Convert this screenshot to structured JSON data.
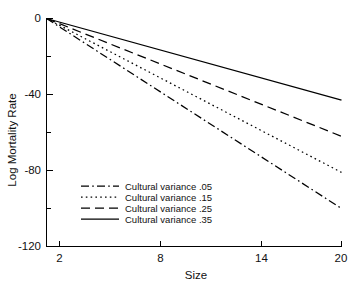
{
  "chart_data": {
    "type": "line",
    "title": "",
    "xlabel": "Size",
    "ylabel": "Log Mortality Rate",
    "xlim": [
      2,
      20
    ],
    "ylim": [
      -120,
      0
    ],
    "xticks": [
      2,
      8,
      14,
      20
    ],
    "xtick_labels": [
      "2",
      "8",
      "14",
      "20"
    ],
    "yticks": [
      0,
      -40,
      -80,
      -120
    ],
    "ytick_labels": [
      "0",
      "-40",
      "-80",
      "-120"
    ],
    "yticks_minor": [
      -20,
      -60,
      -100
    ],
    "grid": false,
    "legend_position": "lower-left-inside",
    "x": [
      2,
      20
    ],
    "series": [
      {
        "name": "Cultural variance .05",
        "style": "dash-dot",
        "color": "#000000",
        "values": [
          0,
          -100
        ]
      },
      {
        "name": "Cultural variance .15",
        "style": "dotted",
        "color": "#000000",
        "values": [
          0,
          -81
        ]
      },
      {
        "name": "Cultural variance .25",
        "style": "dashed",
        "color": "#000000",
        "values": [
          0,
          -62
        ]
      },
      {
        "name": "Cultural variance .35",
        "style": "solid",
        "color": "#000000",
        "values": [
          0,
          -43
        ]
      }
    ]
  },
  "legend": {
    "items": [
      {
        "label": "Cultural variance .05"
      },
      {
        "label": "Cultural variance .15"
      },
      {
        "label": "Cultural variance .25"
      },
      {
        "label": "Cultural variance .35"
      }
    ]
  }
}
